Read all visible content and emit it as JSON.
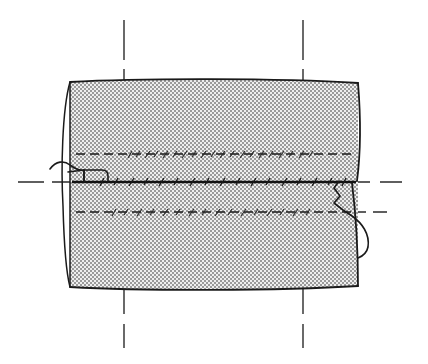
{
  "figure": {
    "type": "engineering-line-drawing",
    "width": 428,
    "height": 364,
    "background_color": "#ffffff"
  },
  "colors": {
    "outline": "#1a1a1a",
    "centerline": "#2b2b2b",
    "hidden_line": "#1a1a1a",
    "seam_line": "#111111",
    "break_line": "#1a1a1a",
    "body_fill_light": "#e8e8e8",
    "body_fill_dot": "#8c8c8c",
    "body_fill_average": "#c9c9c9",
    "paper": "#ffffff"
  },
  "body": {
    "name": "cylinder-body",
    "description": "Stipple-shaded cylindrical shaft body seen in side elevation",
    "left_x": 68,
    "right_x": 358,
    "top_y": 82,
    "bottom_y": 287,
    "top_edge_bulge": 4,
    "bottom_edge_bulge": 4,
    "fill_pattern": "fine-checkerboard-stipple",
    "stroke_width": 1.6
  },
  "end_ellipse": {
    "name": "left-end-ellipse-arc",
    "description": "Partial ellipse showing the near end face of the cylinder",
    "center_x": 71,
    "center_y": 184,
    "radius_x": 8,
    "radius_y": 102,
    "stroke_width": 1.4
  },
  "right_edge": {
    "name": "right-edge-profile",
    "description": "Slightly curved right-hand profile of the cylinder with a small step at the seam",
    "step_y": 182,
    "step_inset": 6
  },
  "centerlines": {
    "style": "long-dash chain (ISO centerline)",
    "stroke_width": 1.4,
    "dash_pattern": "22 9",
    "horizontal": {
      "name": "horizontal-axis-centerline",
      "y": 182,
      "left_segment": {
        "x1": 18,
        "x2": 88
      },
      "right_segment": {
        "x1": 348,
        "x2": 412
      }
    },
    "vertical": [
      {
        "name": "vertical-centerline-left-top",
        "x": 124,
        "y1": 20,
        "y2": 82
      },
      {
        "name": "vertical-centerline-right-top",
        "x": 303,
        "y1": 20,
        "y2": 82
      },
      {
        "name": "vertical-centerline-left-bottom",
        "x": 124,
        "y1": 287,
        "y2": 348
      },
      {
        "name": "vertical-centerline-right-bottom",
        "x": 303,
        "y1": 287,
        "y2": 348
      }
    ]
  },
  "internal_lines": [
    {
      "name": "hidden-line-upper",
      "kind": "hidden-dashed",
      "y": 154,
      "x1": 76,
      "x2": 352,
      "dash_pattern": "9 5",
      "stroke_width": 1.5,
      "has_tick_marks": true,
      "tick_region": {
        "x1": 126,
        "x2": 320
      }
    },
    {
      "name": "weld-seam-centerline",
      "kind": "solid-seam",
      "y": 182,
      "x1": 72,
      "x2": 356,
      "dash_pattern": "none",
      "stroke_width": 2.4,
      "has_tick_marks": true,
      "tick_region": {
        "x1": 96,
        "x2": 348
      }
    },
    {
      "name": "hidden-line-lower",
      "kind": "hidden-dashed",
      "y": 212,
      "x1": 76,
      "x2": 352,
      "dash_pattern": "9 5",
      "stroke_width": 1.5,
      "has_tick_marks": true,
      "tick_region": {
        "x1": 110,
        "x2": 320
      }
    }
  ],
  "break_lines": [
    {
      "name": "left-break-line",
      "description": "Freehand wavy break / leader entering from the left and forming a small rectangular notch at the seam",
      "side": "left",
      "stroke_width": 1.6
    },
    {
      "name": "right-break-line",
      "description": "Freehand jagged break descending from the seam and curving out to the lower right",
      "side": "right",
      "stroke_width": 1.6
    }
  ],
  "labels": {
    "visible_text": []
  }
}
